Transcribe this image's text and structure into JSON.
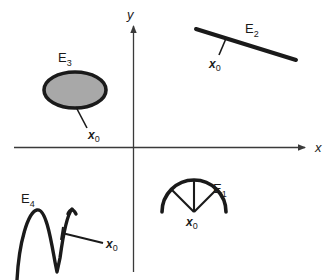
{
  "figure": {
    "background_color": "#ffffff",
    "stroke_color": "#1a1a1a",
    "axis_color": "#3a3a3a",
    "fill_gray": "#a8a8a8"
  },
  "axes": {
    "x_label": "x",
    "y_label": "y",
    "x_axis_name": "horizontal-axis",
    "y_axis_name": "vertical-axis"
  },
  "sets": [
    {
      "id": "E1",
      "label_base": "E",
      "label_sub": "1",
      "shape": "semicircular-arc-with-radii",
      "point_label_base": "x",
      "point_label_sub": "0",
      "quadrant": "fourth"
    },
    {
      "id": "E2",
      "label_base": "E",
      "label_sub": "2",
      "shape": "line-segment",
      "point_label_base": "x",
      "point_label_sub": "0",
      "quadrant": "first"
    },
    {
      "id": "E3",
      "label_base": "E",
      "label_sub": "3",
      "shape": "filled-ellipse",
      "point_label_base": "x",
      "point_label_sub": "0",
      "quadrant": "second"
    },
    {
      "id": "E4",
      "label_base": "E",
      "label_sub": "4",
      "shape": "wavy-curve",
      "point_label_base": "x",
      "point_label_sub": "0",
      "quadrant": "third"
    }
  ]
}
